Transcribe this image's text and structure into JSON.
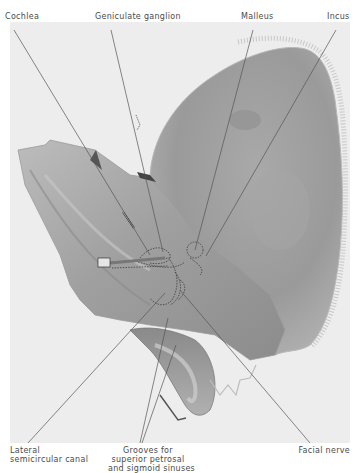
{
  "figure": {
    "labels_top": [
      {
        "id": "cochlea",
        "text": "Cochlea"
      },
      {
        "id": "geniculate_ganglion",
        "text": "Geniculate ganglion"
      },
      {
        "id": "malleus",
        "text": "Malleus"
      },
      {
        "id": "incus",
        "text": "Incus"
      }
    ],
    "labels_bottom": [
      {
        "id": "lateral_semicircular_canal",
        "lines": [
          "Lateral",
          "semicircular canal"
        ]
      },
      {
        "id": "grooves",
        "lines": [
          "Grooves for",
          "superior petrosal",
          "and sigmoid sinuses"
        ]
      },
      {
        "id": "facial_nerve",
        "lines": [
          "Facial nerve"
        ]
      }
    ]
  },
  "colors": {
    "plate_bg": "#ededed",
    "bone_light": "#bdbdbd",
    "bone_mid": "#9e9e9e",
    "bone_dark": "#7a7a7a",
    "leader": "#555555",
    "label": "#4a4a4a"
  }
}
